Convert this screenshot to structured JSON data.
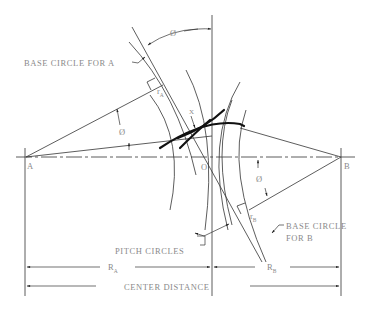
{
  "diagram": {
    "type": "gear-mesh-geometry",
    "labels": {
      "base_circle_a": "BASE CIRCLE FOR A",
      "base_circle_b_line1": "BASE CIRCLE",
      "base_circle_b_line2": "FOR B",
      "pitch_circles": "PITCH CIRCLES",
      "center_distance": "CENTER DISTANCE",
      "point_a": "A",
      "point_b": "B",
      "point_o": "O",
      "point_x": "X",
      "r_a_main": "R",
      "r_a_sub": "A",
      "r_b_main": "R",
      "r_b_sub": "B",
      "rbase_a_main": "r",
      "rbase_a_sub": "A",
      "rbase_b_main": "r",
      "rbase_b_sub": "B",
      "pressure_angle_top": "Ø",
      "pressure_angle_a": "Ø",
      "pressure_angle_b": "Ø"
    },
    "colors": {
      "line": "#333333",
      "thick_line": "#111111",
      "text": "#8a8a8a",
      "background": "#ffffff"
    }
  }
}
